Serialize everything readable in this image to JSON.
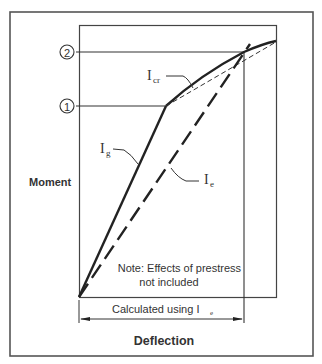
{
  "diagram": {
    "type": "moment-deflection",
    "y_axis_label": "Moment",
    "x_axis_label": "Deflection",
    "points": [
      {
        "id": "1",
        "label": "1",
        "meaning": "cracking moment level"
      },
      {
        "id": "2",
        "label": "2",
        "meaning": "service moment level"
      }
    ],
    "curves": [
      {
        "name": "I_g",
        "label_main": "I",
        "label_sub": "g",
        "style": "solid-thick"
      },
      {
        "name": "I_cr",
        "label_main": "I",
        "label_sub": "cr",
        "style": "solid-thick"
      },
      {
        "name": "I_e",
        "label_main": "I",
        "label_sub": "e",
        "style": "long-dash"
      },
      {
        "name": "I_cr-secant",
        "style": "thin-dash"
      }
    ],
    "note_line1": "Note: Effects of prestress",
    "note_line2": "not included",
    "dimension_label_main": "Calculated using I",
    "dimension_label_sub": "e"
  },
  "colors": {
    "line": "#222222",
    "frame": "#444444",
    "text": "#333333",
    "background": "#ffffff"
  }
}
